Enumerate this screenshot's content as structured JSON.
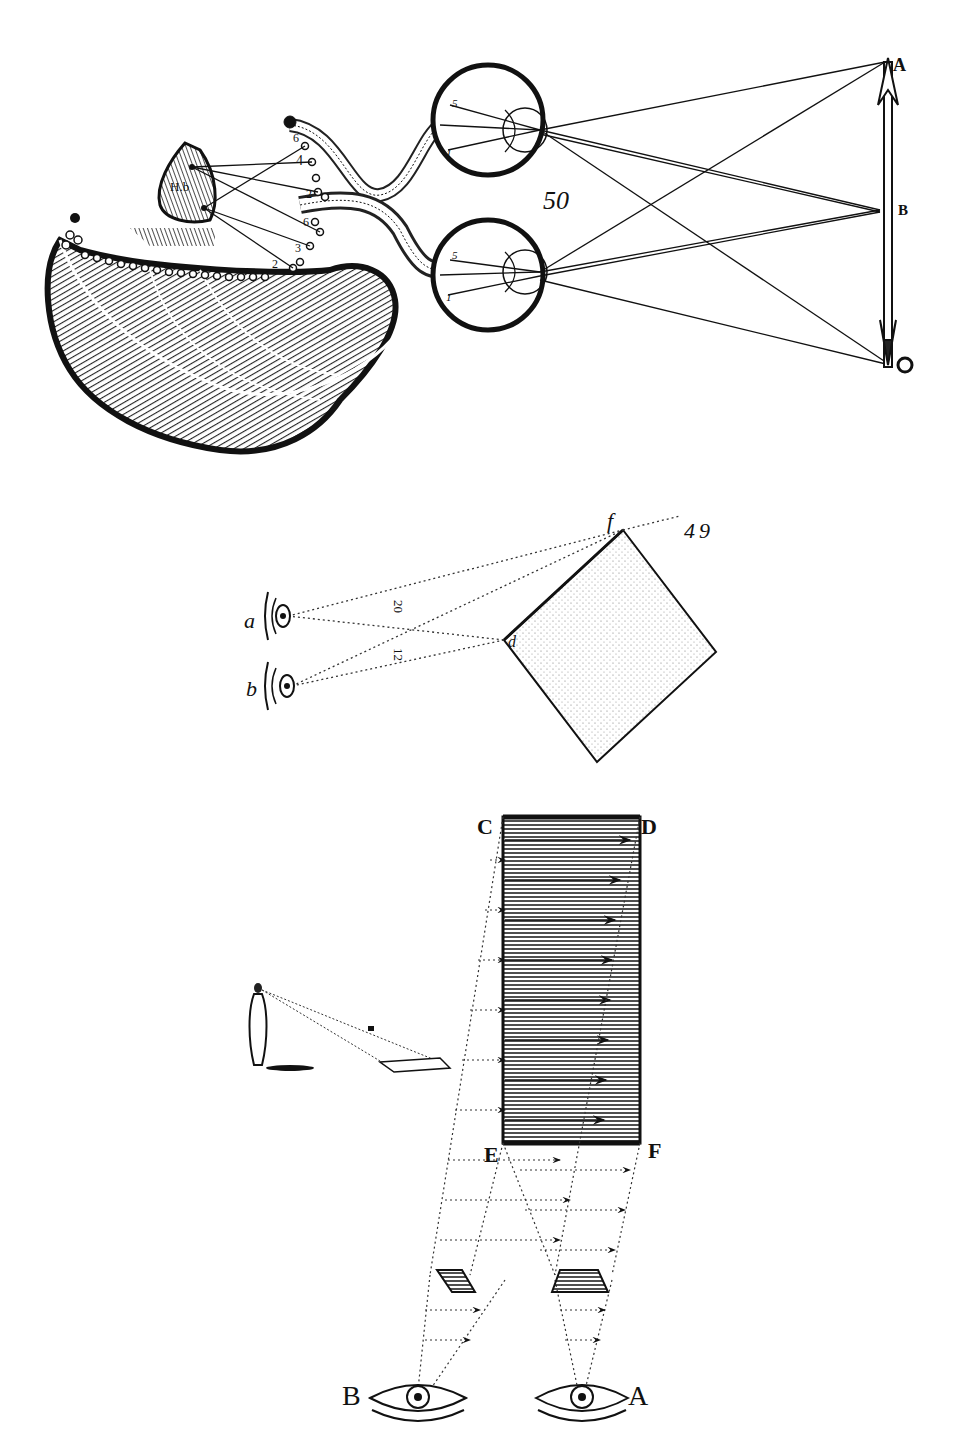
{
  "figure": {
    "colors": {
      "ink": "#111111",
      "paper": "#ffffff",
      "hatch": "#333333",
      "stipple": "#888888"
    }
  },
  "panel_top": {
    "description": "Binocular vision: two eyes with optic nerves leading to the brain and pineal gland, rays from arrow A-B",
    "figure_number": "50",
    "object_labels": {
      "top": "A",
      "middle": "B"
    },
    "gland_label": "H.b",
    "gland_points": [
      "a",
      "b",
      "c"
    ],
    "nerve_numbers_upper": [
      "6",
      "4",
      "2"
    ],
    "nerve_numbers_lower": [
      "6",
      "3",
      "2"
    ],
    "retina_numbers": [
      "5",
      "3",
      "1"
    ]
  },
  "panel_middle": {
    "description": "Two eyes a and b viewing a stippled square with corners f and d",
    "eye_labels": [
      "a",
      "b"
    ],
    "corner_labels": {
      "top": "f",
      "left": "d"
    },
    "distance_labels": [
      "20",
      "12"
    ],
    "figure_number": "49"
  },
  "panel_bottom": {
    "description": "Perspective: rectangle CDEF projected to two eyes A and B; small human figure viewing an inclined plane",
    "rect_labels": {
      "tl": "C",
      "tr": "D",
      "bl": "E",
      "br": "F"
    },
    "eye_labels": {
      "left": "B",
      "right": "A"
    }
  }
}
